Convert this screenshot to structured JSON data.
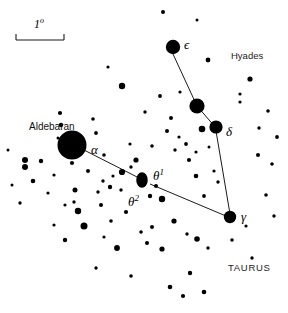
{
  "chart_data": {
    "type": "scatter",
    "xlabel": "",
    "ylabel": "",
    "xlim": [
      0,
      288
    ],
    "ylim": [
      0,
      313
    ],
    "grid": false,
    "legend_position": "none",
    "scale_bar": {
      "label": "1",
      "unit": "o",
      "length_px": 48,
      "x": 16,
      "y": 40
    },
    "labels": [
      {
        "id": "aldebaran",
        "text": "Aldebaran",
        "kind": "proper",
        "x": 29,
        "y": 122
      },
      {
        "id": "alpha",
        "text": "α",
        "kind": "greek",
        "sup": "",
        "x": 91,
        "y": 143
      },
      {
        "id": "epsilon",
        "text": "ϵ",
        "kind": "greek",
        "sup": "",
        "x": 184,
        "y": 38
      },
      {
        "id": "delta",
        "text": "δ",
        "kind": "greek",
        "sup": "",
        "x": 226,
        "y": 125
      },
      {
        "id": "gamma",
        "text": "γ",
        "kind": "greek",
        "sup": "",
        "x": 241,
        "y": 210
      },
      {
        "id": "theta1",
        "text": "θ",
        "kind": "greek",
        "sup": "1",
        "x": 153,
        "y": 168
      },
      {
        "id": "theta2",
        "text": "θ",
        "kind": "greek",
        "sup": "2",
        "x": 128,
        "y": 194
      },
      {
        "id": "hyades",
        "text": "Hyades",
        "kind": "region",
        "x": 231,
        "y": 51
      },
      {
        "id": "taurus",
        "text": "TAURUS",
        "kind": "constellation",
        "x": 228,
        "y": 263
      }
    ],
    "constellation_lines": [
      {
        "from": "epsilon",
        "to": "mid_bright",
        "x1": 173,
        "y1": 54,
        "x2": 197,
        "y2": 106
      },
      {
        "from": "mid_bright",
        "to": "delta",
        "x1": 197,
        "y1": 106,
        "x2": 216,
        "y2": 128
      },
      {
        "from": "delta",
        "to": "gamma",
        "x1": 216,
        "y1": 131,
        "x2": 230,
        "y2": 214
      },
      {
        "from": "alpha",
        "to": "theta1",
        "x1": 82,
        "y1": 149,
        "x2": 143,
        "y2": 180
      },
      {
        "from": "theta1",
        "to": "gamma",
        "x1": 150,
        "y1": 184,
        "x2": 226,
        "y2": 216
      }
    ],
    "named_stars": [
      {
        "name": "Aldebaran",
        "designation": "α",
        "x": 72,
        "y": 145,
        "r": 14.5
      },
      {
        "name": "epsilon Tauri",
        "designation": "ϵ",
        "x": 173,
        "y": 47,
        "r": 7.2
      },
      {
        "name": "unlabeled bright",
        "designation": "",
        "x": 197,
        "y": 106,
        "r": 7.6
      },
      {
        "name": "delta Tauri",
        "designation": "δ",
        "x": 216,
        "y": 127,
        "r": 6.6
      },
      {
        "name": "theta Tauri pair",
        "designation": "θ",
        "x": 142,
        "y": 180,
        "r": 7.0
      },
      {
        "name": "gamma Tauri",
        "designation": "γ",
        "x": 230,
        "y": 217,
        "r": 6.2
      }
    ],
    "field_stars": [
      {
        "x": 108,
        "y": 67,
        "r": 1.6
      },
      {
        "x": 122,
        "y": 86,
        "r": 3.2
      },
      {
        "x": 163,
        "y": 12,
        "r": 2.0
      },
      {
        "x": 197,
        "y": 20,
        "r": 1.5
      },
      {
        "x": 208,
        "y": 60,
        "r": 2.4
      },
      {
        "x": 250,
        "y": 79,
        "r": 2.6
      },
      {
        "x": 180,
        "y": 92,
        "r": 1.6
      },
      {
        "x": 160,
        "y": 96,
        "r": 1.9
      },
      {
        "x": 145,
        "y": 112,
        "r": 1.7
      },
      {
        "x": 171,
        "y": 118,
        "r": 2.0
      },
      {
        "x": 240,
        "y": 94,
        "r": 1.6
      },
      {
        "x": 240,
        "y": 102,
        "r": 1.6
      },
      {
        "x": 268,
        "y": 111,
        "r": 1.8
      },
      {
        "x": 259,
        "y": 128,
        "r": 1.7
      },
      {
        "x": 277,
        "y": 137,
        "r": 1.9
      },
      {
        "x": 202,
        "y": 129,
        "r": 3.3
      },
      {
        "x": 167,
        "y": 131,
        "r": 2.0
      },
      {
        "x": 179,
        "y": 137,
        "r": 1.6
      },
      {
        "x": 186,
        "y": 144,
        "r": 1.9
      },
      {
        "x": 175,
        "y": 150,
        "r": 1.7
      },
      {
        "x": 196,
        "y": 152,
        "r": 1.6
      },
      {
        "x": 189,
        "y": 160,
        "r": 2.1
      },
      {
        "x": 209,
        "y": 147,
        "r": 1.5
      },
      {
        "x": 258,
        "y": 155,
        "r": 2.0
      },
      {
        "x": 272,
        "y": 164,
        "r": 1.8
      },
      {
        "x": 60,
        "y": 113,
        "r": 2.1
      },
      {
        "x": 61,
        "y": 125,
        "r": 2.2
      },
      {
        "x": 93,
        "y": 119,
        "r": 1.8
      },
      {
        "x": 96,
        "y": 133,
        "r": 1.9
      },
      {
        "x": 72,
        "y": 163,
        "r": 2.1
      },
      {
        "x": 25,
        "y": 160,
        "r": 3.0
      },
      {
        "x": 25,
        "y": 167,
        "r": 3.0
      },
      {
        "x": 41,
        "y": 161,
        "r": 2.2
      },
      {
        "x": 8,
        "y": 150,
        "r": 1.5
      },
      {
        "x": 33,
        "y": 181,
        "r": 2.3
      },
      {
        "x": 54,
        "y": 175,
        "r": 1.6
      },
      {
        "x": 88,
        "y": 171,
        "r": 2.0
      },
      {
        "x": 103,
        "y": 181,
        "r": 1.7
      },
      {
        "x": 113,
        "y": 176,
        "r": 1.6
      },
      {
        "x": 122,
        "y": 172,
        "r": 3.1
      },
      {
        "x": 131,
        "y": 167,
        "r": 1.7
      },
      {
        "x": 136,
        "y": 160,
        "r": 2.6
      },
      {
        "x": 156,
        "y": 186,
        "r": 2.0
      },
      {
        "x": 150,
        "y": 196,
        "r": 2.2
      },
      {
        "x": 162,
        "y": 199,
        "r": 3.2
      },
      {
        "x": 121,
        "y": 190,
        "r": 1.7
      },
      {
        "x": 110,
        "y": 187,
        "r": 2.2
      },
      {
        "x": 98,
        "y": 192,
        "r": 1.7
      },
      {
        "x": 75,
        "y": 190,
        "r": 2.5
      },
      {
        "x": 48,
        "y": 193,
        "r": 1.6
      },
      {
        "x": 65,
        "y": 205,
        "r": 1.6
      },
      {
        "x": 78,
        "y": 211,
        "r": 3.2
      },
      {
        "x": 74,
        "y": 202,
        "r": 1.7
      },
      {
        "x": 101,
        "y": 205,
        "r": 2.0
      },
      {
        "x": 84,
        "y": 226,
        "r": 3.5
      },
      {
        "x": 111,
        "y": 221,
        "r": 1.8
      },
      {
        "x": 126,
        "y": 212,
        "r": 2.1
      },
      {
        "x": 141,
        "y": 232,
        "r": 1.8
      },
      {
        "x": 152,
        "y": 227,
        "r": 2.0
      },
      {
        "x": 174,
        "y": 221,
        "r": 2.6
      },
      {
        "x": 187,
        "y": 234,
        "r": 1.7
      },
      {
        "x": 204,
        "y": 196,
        "r": 1.9
      },
      {
        "x": 196,
        "y": 176,
        "r": 2.3
      },
      {
        "x": 218,
        "y": 182,
        "r": 1.7
      },
      {
        "x": 214,
        "y": 171,
        "r": 1.6
      },
      {
        "x": 266,
        "y": 195,
        "r": 1.8
      },
      {
        "x": 274,
        "y": 216,
        "r": 1.7
      },
      {
        "x": 246,
        "y": 226,
        "r": 1.6
      },
      {
        "x": 197,
        "y": 239,
        "r": 2.8
      },
      {
        "x": 208,
        "y": 248,
        "r": 1.7
      },
      {
        "x": 162,
        "y": 249,
        "r": 2.6
      },
      {
        "x": 147,
        "y": 243,
        "r": 2.0
      },
      {
        "x": 117,
        "y": 248,
        "r": 2.9
      },
      {
        "x": 104,
        "y": 237,
        "r": 1.6
      },
      {
        "x": 65,
        "y": 240,
        "r": 2.2
      },
      {
        "x": 54,
        "y": 225,
        "r": 1.6
      },
      {
        "x": 232,
        "y": 240,
        "r": 1.8
      },
      {
        "x": 252,
        "y": 258,
        "r": 1.7
      },
      {
        "x": 190,
        "y": 273,
        "r": 2.2
      },
      {
        "x": 170,
        "y": 287,
        "r": 2.3
      },
      {
        "x": 183,
        "y": 296,
        "r": 2.1
      },
      {
        "x": 204,
        "y": 292,
        "r": 2.3
      },
      {
        "x": 131,
        "y": 276,
        "r": 1.8
      },
      {
        "x": 96,
        "y": 268,
        "r": 1.7
      },
      {
        "x": 20,
        "y": 203,
        "r": 1.7
      },
      {
        "x": 12,
        "y": 185,
        "r": 1.5
      },
      {
        "x": 58,
        "y": 138,
        "r": 1.5
      },
      {
        "x": 104,
        "y": 155,
        "r": 1.8
      },
      {
        "x": 130,
        "y": 144,
        "r": 1.6
      },
      {
        "x": 152,
        "y": 146,
        "r": 1.8
      }
    ]
  },
  "meta": {
    "background_color": "#ffffff",
    "star_color": "#000000",
    "line_color": "#000000"
  }
}
